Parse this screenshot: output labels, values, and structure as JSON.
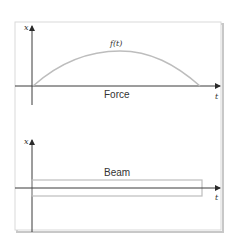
{
  "colors": {
    "frame": "#d9d9d9",
    "frame_shadow": "#c8c8c8",
    "axis": "#3a3a3a",
    "curve": "#bdbdbd",
    "beam": "#bdbdbd",
    "text": "#333333"
  },
  "top_panel": {
    "y_axis_label": "x",
    "x_axis_label": "t",
    "curve_label": "f(t)",
    "caption": "Force"
  },
  "bottom_panel": {
    "y_axis_label": "x",
    "x_axis_label": "t",
    "caption": "Beam"
  }
}
